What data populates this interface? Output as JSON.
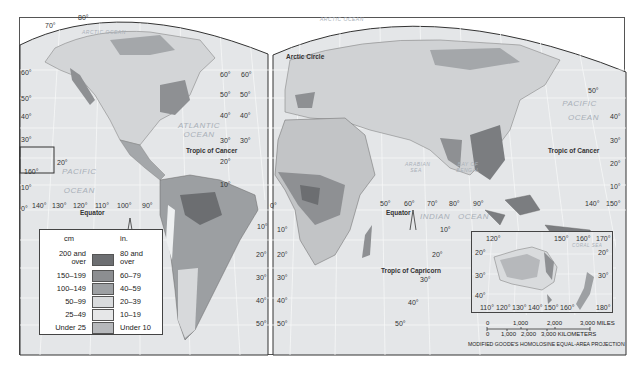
{
  "map": {
    "projection": "MODIFIED GOODE'S HOMOLOSINE EQUAL-AREA PROJECTION",
    "legend": {
      "unit_left": "cm",
      "unit_right": "in.",
      "classes": [
        {
          "cm": "200 and over",
          "in": "80 and over",
          "color": "#6d6f72"
        },
        {
          "cm": "150–199",
          "in": "60–79",
          "color": "#8c8e91"
        },
        {
          "cm": "100–149",
          "in": "40–59",
          "color": "#9da0a3"
        },
        {
          "cm": "50–99",
          "in": "20–39",
          "color": "#d9dbdd"
        },
        {
          "cm": "25–49",
          "in": "10–19",
          "color": "#e6e7e8"
        },
        {
          "cm": "Under 25",
          "in": "Under 10",
          "color": "#b6b8bb"
        }
      ]
    },
    "scale": {
      "miles": [
        "0",
        "1,000",
        "2,000",
        "3,000 MILES"
      ],
      "kilometers": [
        "0",
        "1,000",
        "2,000",
        "3,000 KILOMETERS"
      ]
    },
    "oceans": {
      "arctic_w": "ARCTIC OCEAN",
      "arctic_e": "ARCTIC OCEAN",
      "atlantic_1": "ATLANTIC",
      "atlantic_2": "OCEAN",
      "pacific_w_1": "PACIFIC",
      "pacific_w_2": "OCEAN",
      "pacific_e_1": "PACIFIC",
      "pacific_e_2": "OCEAN",
      "indian_1": "INDIAN",
      "indian_2": "OCEAN",
      "arabian_sea": "ARABIAN SEA",
      "bay_of_bengal": "BAY OF BENGAL",
      "coral_sea": "CORAL SEA"
    },
    "lines": {
      "arctic_circle": "Arctic Circle",
      "tropic_cancer_w": "Tropic of Cancer",
      "tropic_cancer_e": "Tropic of Cancer",
      "tropic_capricorn": "Tropic of Capricorn",
      "equator_w": "Equator",
      "equator_e": "Equator"
    },
    "lat_labels": {
      "w_left": [
        "60°",
        "50°",
        "40°",
        "30°",
        "20°",
        "10°",
        "0°"
      ],
      "w_mid": [
        "60°",
        "50°",
        "40°",
        "30°",
        "20°",
        "10°",
        "0°",
        "10°",
        "20°",
        "30°",
        "40°",
        "50°"
      ],
      "e_left": [
        "60°",
        "50°",
        "40°",
        "30°",
        "10°",
        "20°",
        "30°",
        "40°",
        "50°"
      ],
      "e_right": [
        "50°",
        "40°",
        "30°",
        "20°",
        "10°",
        "10°",
        "20°",
        "30°",
        "40°",
        "50°"
      ],
      "south_w": [
        "10°",
        "20°",
        "30°",
        "40°",
        "50°"
      ],
      "top_w": [
        "70°",
        "80°"
      ],
      "hawaii": [
        "20°",
        "160°"
      ]
    },
    "lon_labels": {
      "pacific": [
        "140°",
        "130°",
        "120°",
        "110°",
        "100°",
        "90°"
      ],
      "indian": [
        "50°",
        "60°",
        "70°",
        "80°",
        "90°"
      ],
      "east": [
        "140°",
        "150°"
      ],
      "inset_top": [
        "120°",
        "150°",
        "160°",
        "170°"
      ],
      "inset_bottom": [
        "110°",
        "120°",
        "130°",
        "140°",
        "150°",
        "160°",
        "180°"
      ],
      "inset_lat_left": [
        "20°",
        "30°",
        "40°"
      ],
      "inset_lat_right": [
        "20°",
        "30°"
      ]
    }
  }
}
